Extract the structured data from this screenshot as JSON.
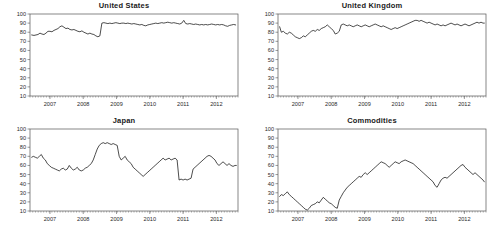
{
  "figure": {
    "background": "#ffffff",
    "line_color": "#111111",
    "axis_color": "#555555",
    "layout": "2x2 grid of time-series panels"
  },
  "chart_data": [
    {
      "type": "line",
      "title": "United States",
      "xlabel": "",
      "ylabel": "",
      "ylim": [
        10,
        100
      ],
      "xlim": [
        2006.4,
        2012.65
      ],
      "yticks": [
        10,
        20,
        30,
        40,
        50,
        60,
        70,
        80,
        90,
        100
      ],
      "xticks": [
        2007,
        2008,
        2009,
        2010,
        2011,
        2012
      ],
      "grid": false,
      "legend": "none",
      "x": [
        2006.45,
        2006.52,
        2006.58,
        2006.64,
        2006.7,
        2006.76,
        2006.82,
        2006.88,
        2006.94,
        2007.0,
        2007.06,
        2007.12,
        2007.18,
        2007.24,
        2007.3,
        2007.36,
        2007.42,
        2007.48,
        2007.54,
        2007.6,
        2007.66,
        2007.72,
        2007.78,
        2007.84,
        2007.9,
        2007.96,
        2008.02,
        2008.08,
        2008.14,
        2008.2,
        2008.26,
        2008.32,
        2008.38,
        2008.44,
        2008.5,
        2008.56,
        2008.62,
        2008.68,
        2008.74,
        2008.8,
        2008.86,
        2008.92,
        2008.98,
        2009.04,
        2009.1,
        2009.16,
        2009.22,
        2009.28,
        2009.34,
        2009.4,
        2009.46,
        2009.52,
        2009.58,
        2009.64,
        2009.7,
        2009.76,
        2009.82,
        2009.88,
        2009.94,
        2010.0,
        2010.06,
        2010.12,
        2010.18,
        2010.24,
        2010.3,
        2010.36,
        2010.42,
        2010.48,
        2010.54,
        2010.6,
        2010.66,
        2010.72,
        2010.78,
        2010.84,
        2010.9,
        2010.96,
        2011.02,
        2011.08,
        2011.14,
        2011.2,
        2011.26,
        2011.32,
        2011.38,
        2011.44,
        2011.5,
        2011.56,
        2011.62,
        2011.68,
        2011.74,
        2011.8,
        2011.86,
        2011.92,
        2011.98,
        2012.04,
        2012.1,
        2012.16,
        2012.22,
        2012.28,
        2012.34,
        2012.4,
        2012.46,
        2012.52,
        2012.58
      ],
      "values": [
        77,
        76.5,
        77,
        77.5,
        79,
        78,
        77.5,
        79,
        81,
        81,
        80.5,
        82,
        83,
        84,
        86,
        87,
        85.5,
        84,
        84.5,
        83,
        82.5,
        83,
        82,
        81,
        80.5,
        81.5,
        80,
        79,
        78,
        79,
        78,
        77.5,
        76,
        75,
        76,
        90,
        90.5,
        90,
        89.5,
        90,
        89.5,
        90,
        90.5,
        90,
        89.5,
        90,
        90,
        89.5,
        90,
        89.5,
        89,
        89.5,
        89,
        88.5,
        88,
        88.5,
        87.5,
        87,
        88,
        88.5,
        89,
        89.5,
        90,
        89.5,
        90,
        90.5,
        90,
        90.5,
        91,
        90.5,
        90,
        90.5,
        90,
        89.5,
        89,
        90,
        93,
        89.5,
        89,
        89.5,
        89,
        88.5,
        89,
        88.5,
        88,
        88.5,
        88,
        88.5,
        88,
        88.5,
        89,
        88.5,
        88,
        88.5,
        88,
        88.5,
        88,
        87,
        86.5,
        87.5,
        88,
        88.5,
        88
      ]
    },
    {
      "type": "line",
      "title": "United Kingdom",
      "xlabel": "",
      "ylabel": "",
      "ylim": [
        10,
        100
      ],
      "xlim": [
        2006.4,
        2012.65
      ],
      "yticks": [
        10,
        20,
        30,
        40,
        50,
        60,
        70,
        80,
        90,
        100
      ],
      "xticks": [
        2007,
        2008,
        2009,
        2010,
        2011,
        2012
      ],
      "grid": false,
      "legend": "none",
      "x": [
        2006.45,
        2006.5,
        2006.56,
        2006.62,
        2006.68,
        2006.74,
        2006.8,
        2006.86,
        2006.92,
        2006.98,
        2007.04,
        2007.1,
        2007.16,
        2007.22,
        2007.28,
        2007.34,
        2007.4,
        2007.46,
        2007.52,
        2007.58,
        2007.64,
        2007.7,
        2007.76,
        2007.82,
        2007.88,
        2007.94,
        2008.0,
        2008.06,
        2008.12,
        2008.18,
        2008.24,
        2008.3,
        2008.36,
        2008.42,
        2008.48,
        2008.54,
        2008.6,
        2008.66,
        2008.72,
        2008.78,
        2008.84,
        2008.9,
        2008.96,
        2009.02,
        2009.08,
        2009.14,
        2009.2,
        2009.26,
        2009.32,
        2009.38,
        2009.44,
        2009.5,
        2009.56,
        2009.62,
        2009.68,
        2009.74,
        2009.8,
        2009.86,
        2009.92,
        2009.98,
        2010.04,
        2010.1,
        2010.16,
        2010.22,
        2010.28,
        2010.34,
        2010.4,
        2010.46,
        2010.52,
        2010.58,
        2010.64,
        2010.7,
        2010.76,
        2010.82,
        2010.88,
        2010.94,
        2011.0,
        2011.06,
        2011.12,
        2011.18,
        2011.24,
        2011.3,
        2011.36,
        2011.42,
        2011.48,
        2011.54,
        2011.6,
        2011.66,
        2011.72,
        2011.78,
        2011.84,
        2011.9,
        2011.96,
        2012.02,
        2012.08,
        2012.14,
        2012.2,
        2012.26,
        2012.32,
        2012.38,
        2012.44,
        2012.5,
        2012.56,
        2012.6
      ],
      "values": [
        86,
        80,
        81,
        79,
        78,
        80,
        79,
        77,
        75,
        74,
        73,
        74,
        76,
        75,
        77,
        79,
        81,
        82,
        81,
        83,
        82,
        84,
        85,
        86,
        88,
        86,
        84,
        82,
        78,
        79,
        81,
        88,
        89,
        88,
        87,
        88,
        87,
        86,
        87,
        88,
        87,
        86,
        87,
        88,
        87,
        86,
        87,
        88,
        89,
        88,
        87,
        86,
        87,
        86,
        85,
        84,
        83,
        84,
        85,
        84,
        85,
        86,
        87,
        88,
        89,
        90,
        91,
        92,
        93,
        93,
        92,
        93,
        92,
        91,
        90,
        91,
        90,
        89,
        88,
        89,
        88,
        87,
        88,
        87,
        88,
        89,
        90,
        89,
        88,
        89,
        88,
        87,
        88,
        89,
        88,
        87,
        88,
        89,
        90,
        91,
        90,
        91,
        90,
        90
      ]
    },
    {
      "type": "line",
      "title": "Japan",
      "xlabel": "",
      "ylabel": "",
      "ylim": [
        10,
        100
      ],
      "xlim": [
        2006.4,
        2012.65
      ],
      "yticks": [
        10,
        20,
        30,
        40,
        50,
        60,
        70,
        80,
        90,
        100
      ],
      "xticks": [
        2007,
        2008,
        2009,
        2010,
        2011,
        2012
      ],
      "grid": false,
      "legend": "none",
      "x": [
        2006.45,
        2006.5,
        2006.56,
        2006.62,
        2006.68,
        2006.74,
        2006.8,
        2006.86,
        2006.92,
        2006.98,
        2007.04,
        2007.1,
        2007.16,
        2007.22,
        2007.28,
        2007.34,
        2007.4,
        2007.46,
        2007.52,
        2007.58,
        2007.64,
        2007.7,
        2007.76,
        2007.82,
        2007.88,
        2007.94,
        2008.0,
        2008.06,
        2008.12,
        2008.18,
        2008.24,
        2008.3,
        2008.36,
        2008.42,
        2008.48,
        2008.54,
        2008.6,
        2008.66,
        2008.72,
        2008.78,
        2008.84,
        2008.9,
        2008.96,
        2009.02,
        2009.08,
        2009.14,
        2009.2,
        2009.26,
        2009.32,
        2009.38,
        2009.44,
        2009.5,
        2009.56,
        2009.62,
        2009.68,
        2009.74,
        2009.8,
        2009.86,
        2009.92,
        2009.98,
        2010.04,
        2010.1,
        2010.16,
        2010.22,
        2010.28,
        2010.34,
        2010.4,
        2010.46,
        2010.52,
        2010.58,
        2010.64,
        2010.7,
        2010.76,
        2010.82,
        2010.88,
        2010.94,
        2011.0,
        2011.06,
        2011.12,
        2011.18,
        2011.24,
        2011.3,
        2011.36,
        2011.42,
        2011.48,
        2011.54,
        2011.6,
        2011.66,
        2011.72,
        2011.78,
        2011.84,
        2011.9,
        2011.96,
        2012.02,
        2012.08,
        2012.14,
        2012.2,
        2012.26,
        2012.32,
        2012.38,
        2012.44,
        2012.5,
        2012.56,
        2012.6
      ],
      "values": [
        69,
        70,
        69,
        68,
        70,
        72,
        68,
        66,
        62,
        60,
        58,
        57,
        56,
        55,
        54,
        56,
        57,
        55,
        56,
        60,
        57,
        55,
        56,
        58,
        55,
        54,
        55,
        57,
        58,
        60,
        62,
        66,
        72,
        78,
        82,
        84,
        85,
        84,
        85,
        84,
        83,
        84,
        83,
        82,
        70,
        66,
        68,
        70,
        66,
        64,
        62,
        58,
        56,
        54,
        52,
        50,
        48,
        50,
        52,
        54,
        56,
        58,
        60,
        62,
        64,
        66,
        68,
        66,
        67,
        68,
        66,
        67,
        68,
        66,
        44,
        45,
        44,
        45,
        44,
        45,
        46,
        56,
        58,
        60,
        62,
        64,
        66,
        68,
        70,
        71,
        70,
        68,
        66,
        62,
        60,
        62,
        64,
        62,
        60,
        62,
        60,
        59,
        60,
        60
      ]
    },
    {
      "type": "line",
      "title": "Commodities",
      "xlabel": "",
      "ylabel": "",
      "ylim": [
        10,
        100
      ],
      "xlim": [
        2006.4,
        2012.65
      ],
      "yticks": [
        10,
        20,
        30,
        40,
        50,
        60,
        70,
        80,
        90,
        100
      ],
      "xticks": [
        2007,
        2008,
        2009,
        2010,
        2011,
        2012
      ],
      "grid": false,
      "legend": "none",
      "x": [
        2006.45,
        2006.5,
        2006.56,
        2006.62,
        2006.68,
        2006.74,
        2006.8,
        2006.86,
        2006.92,
        2006.98,
        2007.04,
        2007.1,
        2007.16,
        2007.22,
        2007.28,
        2007.34,
        2007.4,
        2007.46,
        2007.52,
        2007.58,
        2007.64,
        2007.7,
        2007.76,
        2007.82,
        2007.88,
        2007.94,
        2008.0,
        2008.06,
        2008.12,
        2008.18,
        2008.24,
        2008.3,
        2008.36,
        2008.42,
        2008.48,
        2008.54,
        2008.6,
        2008.66,
        2008.72,
        2008.78,
        2008.84,
        2008.9,
        2008.96,
        2009.02,
        2009.08,
        2009.14,
        2009.2,
        2009.26,
        2009.32,
        2009.38,
        2009.44,
        2009.5,
        2009.56,
        2009.62,
        2009.68,
        2009.74,
        2009.8,
        2009.86,
        2009.92,
        2009.98,
        2010.04,
        2010.1,
        2010.16,
        2010.22,
        2010.28,
        2010.34,
        2010.4,
        2010.46,
        2010.52,
        2010.58,
        2010.64,
        2010.7,
        2010.76,
        2010.82,
        2010.88,
        2010.94,
        2011.0,
        2011.06,
        2011.12,
        2011.18,
        2011.24,
        2011.3,
        2011.36,
        2011.42,
        2011.48,
        2011.54,
        2011.6,
        2011.66,
        2011.72,
        2011.78,
        2011.84,
        2011.9,
        2011.96,
        2012.02,
        2012.08,
        2012.14,
        2012.2,
        2012.26,
        2012.32,
        2012.38,
        2012.44,
        2012.5,
        2012.56,
        2012.6
      ],
      "values": [
        26,
        28,
        27,
        29,
        31,
        28,
        26,
        24,
        22,
        20,
        18,
        16,
        14,
        12,
        11,
        13,
        16,
        17,
        18,
        20,
        19,
        22,
        25,
        23,
        21,
        19,
        18,
        16,
        14,
        13,
        22,
        26,
        30,
        33,
        36,
        38,
        40,
        42,
        44,
        46,
        48,
        47,
        50,
        52,
        50,
        52,
        54,
        56,
        58,
        60,
        62,
        64,
        63,
        62,
        60,
        58,
        60,
        62,
        64,
        63,
        62,
        64,
        65,
        66,
        65,
        64,
        63,
        62,
        60,
        58,
        56,
        54,
        52,
        50,
        48,
        46,
        44,
        42,
        38,
        36,
        40,
        44,
        46,
        47,
        46,
        48,
        50,
        52,
        54,
        56,
        58,
        60,
        61,
        58,
        56,
        54,
        52,
        50,
        52,
        50,
        48,
        46,
        44,
        42
      ]
    }
  ]
}
